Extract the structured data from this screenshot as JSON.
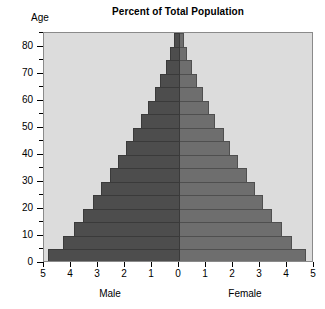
{
  "chart_data": {
    "type": "bar",
    "subtype": "population-pyramid",
    "title": "Percent of Total Population",
    "xlabel": "",
    "ylabel": "Age",
    "orientation": "horizontal",
    "grid": false,
    "legend": null,
    "axis_corner_label": "Age",
    "y_axis": {
      "label": "Age",
      "range": [
        0,
        85
      ],
      "major_ticks": [
        0,
        10,
        20,
        30,
        40,
        50,
        60,
        70,
        80
      ],
      "major_tick_labels": [
        "0",
        "10",
        "20",
        "30",
        "40",
        "50",
        "60",
        "70",
        "80"
      ],
      "minor_ticks": [
        5,
        15,
        25,
        35,
        45,
        55,
        65,
        75,
        85
      ],
      "band_width": 5
    },
    "x_axis": {
      "range": [
        -5,
        5
      ],
      "ticks": [
        -5,
        -4,
        -3,
        -2,
        -1,
        0,
        1,
        2,
        3,
        4,
        5
      ],
      "tick_labels": [
        "5",
        "4",
        "3",
        "2",
        "1",
        "0",
        "1",
        "2",
        "3",
        "4",
        "5"
      ],
      "unit": "percent of total population",
      "left_group_label": "Male",
      "right_group_label": "Female"
    },
    "categories": [
      "0-4",
      "5-9",
      "10-14",
      "15-19",
      "20-24",
      "25-29",
      "30-34",
      "35-39",
      "40-44",
      "45-49",
      "50-54",
      "55-59",
      "60-64",
      "65-69",
      "70-74",
      "75-79",
      "80-84",
      "85+"
    ],
    "series": [
      {
        "name": "Male",
        "side": "left",
        "color": "#4d4d4d",
        "values": [
          4.85,
          4.3,
          3.9,
          3.55,
          3.2,
          2.9,
          2.55,
          2.25,
          1.95,
          1.7,
          1.4,
          1.15,
          0.9,
          0.7,
          0.5,
          0.32,
          0.18,
          0.08
        ]
      },
      {
        "name": "Female",
        "side": "right",
        "color": "#6e6e6e",
        "values": [
          4.7,
          4.2,
          3.8,
          3.45,
          3.1,
          2.8,
          2.5,
          2.2,
          1.9,
          1.65,
          1.35,
          1.1,
          0.88,
          0.68,
          0.48,
          0.3,
          0.17,
          0.07
        ]
      }
    ],
    "colors": {
      "male_bar": "#4d4d4d",
      "female_bar": "#6e6e6e",
      "plot_background": "#dcdcdc",
      "page_background": "#ffffff",
      "axis": "#000000",
      "plot_border": "#8a8a8a"
    }
  }
}
